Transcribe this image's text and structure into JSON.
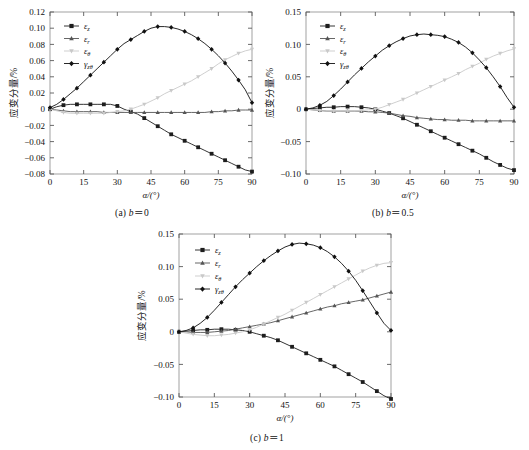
{
  "figure": {
    "panels": [
      {
        "id": "a",
        "caption": "（a）b＝0",
        "caption_label": "(a)",
        "caption_param": "b",
        "caption_value": "0",
        "x_axis_title": "α/(°)",
        "y_axis_title": "应变分量/%",
        "x_ticks": [
          "0",
          "15",
          "30",
          "45",
          "60",
          "75",
          "90"
        ],
        "y_ticks": [
          "0.12",
          "0.10",
          "0.08",
          "0.06",
          "0.04",
          "0.02",
          "0",
          "-0.02",
          "-0.04",
          "-0.06",
          "-0.08"
        ]
      },
      {
        "id": "b",
        "caption": "（b）b＝0.5",
        "caption_label": "(b)",
        "caption_param": "b",
        "caption_value": "0.5",
        "x_axis_title": "α/(°)",
        "y_axis_title": "应变分量/%",
        "x_ticks": [
          "0",
          "15",
          "30",
          "45",
          "60",
          "75",
          "90"
        ],
        "y_ticks": [
          "0.15",
          "0.10",
          "0.05",
          "0",
          "-0.05",
          "-0.10"
        ]
      },
      {
        "id": "c",
        "caption": "（c）b＝1",
        "caption_label": "(c)",
        "caption_param": "b",
        "caption_value": "1",
        "x_axis_title": "α/(°)",
        "y_axis_title": "应变分量/%",
        "x_ticks": [
          "0",
          "15",
          "30",
          "45",
          "60",
          "75",
          "90"
        ],
        "y_ticks": [
          "0.15",
          "0.10",
          "0.05",
          "0",
          "-0.05",
          "-0.10"
        ]
      }
    ],
    "legend_entries": [
      {
        "key": "eps_z",
        "label": "εz",
        "base": "ε",
        "sub": "z",
        "color": "#1d1d1d",
        "marker": "square"
      },
      {
        "key": "eps_r",
        "label": "εr",
        "base": "ε",
        "sub": "r",
        "color": "#555555",
        "marker": "triangle-up"
      },
      {
        "key": "eps_theta",
        "label": "εθ",
        "base": "ε",
        "sub": "θ",
        "color": "#c9c9c9",
        "marker": "triangle-down"
      },
      {
        "key": "gamma_zt",
        "label": "γzθ",
        "base": "γ",
        "sub": "zθ",
        "color": "#111111",
        "marker": "diamond"
      }
    ]
  },
  "chart_data": [
    {
      "type": "line",
      "panel": "a",
      "title": "（a）b＝0",
      "xlabel": "α/(°)",
      "ylabel": "应变分量/%",
      "xlim": [
        0,
        90
      ],
      "ylim": [
        -0.08,
        0.12
      ],
      "xticks": [
        0,
        15,
        30,
        45,
        60,
        75,
        90
      ],
      "yticks": [
        -0.08,
        -0.06,
        -0.04,
        -0.02,
        0,
        0.02,
        0.04,
        0.06,
        0.08,
        0.1,
        0.12
      ],
      "grid": false,
      "legend_position": "upper-left",
      "x": [
        0,
        3,
        6,
        9,
        12,
        15,
        18,
        21,
        24,
        27,
        30,
        33,
        36,
        39,
        42,
        45,
        48,
        51,
        54,
        57,
        60,
        63,
        66,
        69,
        72,
        75,
        78,
        81,
        84,
        87,
        90
      ],
      "series": [
        {
          "name": "εz",
          "color": "#1d1d1d",
          "marker": "square",
          "values": [
            0.0,
            0.003,
            0.005,
            0.006,
            0.006,
            0.006,
            0.006,
            0.006,
            0.006,
            0.006,
            0.004,
            0.0,
            -0.003,
            -0.006,
            -0.011,
            -0.016,
            -0.021,
            -0.026,
            -0.031,
            -0.035,
            -0.039,
            -0.043,
            -0.047,
            -0.051,
            -0.055,
            -0.059,
            -0.063,
            -0.067,
            -0.071,
            -0.075,
            -0.077
          ]
        },
        {
          "name": "εr",
          "color": "#555555",
          "marker": "triangle-up",
          "values": [
            0.0,
            -0.001,
            -0.002,
            -0.003,
            -0.003,
            -0.003,
            -0.003,
            -0.003,
            -0.004,
            -0.004,
            -0.004,
            -0.004,
            -0.004,
            -0.004,
            -0.004,
            -0.004,
            -0.004,
            -0.004,
            -0.004,
            -0.004,
            -0.004,
            -0.004,
            -0.004,
            -0.004,
            -0.003,
            -0.003,
            -0.002,
            -0.002,
            -0.001,
            -0.001,
            -0.001
          ]
        },
        {
          "name": "εθ",
          "color": "#c9c9c9",
          "marker": "triangle-down",
          "values": [
            0.0,
            -0.002,
            -0.004,
            -0.005,
            -0.005,
            -0.005,
            -0.005,
            -0.005,
            -0.005,
            -0.004,
            -0.003,
            -0.002,
            0.0,
            0.003,
            0.006,
            0.01,
            0.014,
            0.019,
            0.023,
            0.027,
            0.031,
            0.035,
            0.04,
            0.045,
            0.05,
            0.056,
            0.061,
            0.065,
            0.069,
            0.072,
            0.074
          ]
        },
        {
          "name": "γzθ",
          "color": "#111111",
          "marker": "diamond",
          "values": [
            0.002,
            0.006,
            0.012,
            0.019,
            0.026,
            0.034,
            0.042,
            0.05,
            0.058,
            0.066,
            0.074,
            0.081,
            0.086,
            0.091,
            0.096,
            0.1,
            0.102,
            0.102,
            0.101,
            0.099,
            0.096,
            0.092,
            0.087,
            0.081,
            0.074,
            0.066,
            0.057,
            0.047,
            0.036,
            0.024,
            0.008
          ]
        }
      ]
    },
    {
      "type": "line",
      "panel": "b",
      "title": "（b）b＝0.5",
      "xlabel": "α/(°)",
      "ylabel": "应变分量/%",
      "xlim": [
        0,
        90
      ],
      "ylim": [
        -0.1,
        0.15
      ],
      "xticks": [
        0,
        15,
        30,
        45,
        60,
        75,
        90
      ],
      "yticks": [
        -0.1,
        -0.05,
        0,
        0.05,
        0.1,
        0.15
      ],
      "grid": false,
      "legend_position": "upper-left",
      "x": [
        0,
        3,
        6,
        9,
        12,
        15,
        18,
        21,
        24,
        27,
        30,
        33,
        36,
        39,
        42,
        45,
        48,
        51,
        54,
        57,
        60,
        63,
        66,
        69,
        72,
        75,
        78,
        81,
        84,
        87,
        90
      ],
      "series": [
        {
          "name": "εz",
          "color": "#1d1d1d",
          "marker": "square",
          "values": [
            0.0,
            0.001,
            0.002,
            0.003,
            0.003,
            0.004,
            0.004,
            0.004,
            0.003,
            0.002,
            0.0,
            -0.003,
            -0.006,
            -0.01,
            -0.014,
            -0.019,
            -0.024,
            -0.029,
            -0.034,
            -0.039,
            -0.044,
            -0.049,
            -0.054,
            -0.059,
            -0.064,
            -0.069,
            -0.075,
            -0.081,
            -0.086,
            -0.091,
            -0.094
          ]
        },
        {
          "name": "εr",
          "color": "#555555",
          "marker": "triangle-up",
          "values": [
            0.0,
            -0.001,
            -0.002,
            -0.003,
            -0.003,
            -0.003,
            -0.003,
            -0.003,
            -0.003,
            -0.004,
            -0.004,
            -0.005,
            -0.006,
            -0.008,
            -0.01,
            -0.011,
            -0.013,
            -0.014,
            -0.015,
            -0.016,
            -0.016,
            -0.017,
            -0.017,
            -0.017,
            -0.018,
            -0.018,
            -0.018,
            -0.018,
            -0.018,
            -0.018,
            -0.018
          ]
        },
        {
          "name": "εθ",
          "color": "#c9c9c9",
          "marker": "triangle-down",
          "values": [
            0.0,
            -0.001,
            -0.002,
            -0.003,
            -0.003,
            -0.003,
            -0.003,
            -0.003,
            -0.002,
            -0.001,
            0.0,
            0.003,
            0.007,
            0.011,
            0.015,
            0.02,
            0.025,
            0.03,
            0.035,
            0.04,
            0.045,
            0.05,
            0.055,
            0.061,
            0.066,
            0.071,
            0.077,
            0.082,
            0.086,
            0.09,
            0.093
          ]
        },
        {
          "name": "γzθ",
          "color": "#111111",
          "marker": "diamond",
          "values": [
            0.0,
            0.002,
            0.006,
            0.012,
            0.021,
            0.031,
            0.042,
            0.053,
            0.063,
            0.073,
            0.082,
            0.091,
            0.098,
            0.104,
            0.109,
            0.113,
            0.115,
            0.116,
            0.115,
            0.114,
            0.112,
            0.108,
            0.103,
            0.096,
            0.087,
            0.076,
            0.064,
            0.05,
            0.035,
            0.018,
            0.003
          ]
        }
      ]
    },
    {
      "type": "line",
      "panel": "c",
      "title": "（c）b＝1",
      "xlabel": "α/(°)",
      "ylabel": "应变分量/%",
      "xlim": [
        0,
        90
      ],
      "ylim": [
        -0.1,
        0.15
      ],
      "xticks": [
        0,
        15,
        30,
        45,
        60,
        75,
        90
      ],
      "yticks": [
        -0.1,
        -0.05,
        0,
        0.05,
        0.1,
        0.15
      ],
      "grid": false,
      "legend_position": "upper-left",
      "x": [
        0,
        3,
        6,
        9,
        12,
        15,
        18,
        21,
        24,
        27,
        30,
        33,
        36,
        39,
        42,
        45,
        48,
        51,
        54,
        57,
        60,
        63,
        66,
        69,
        72,
        75,
        78,
        81,
        84,
        87,
        90
      ],
      "series": [
        {
          "name": "εz",
          "color": "#1d1d1d",
          "marker": "square",
          "values": [
            0.0,
            0.001,
            0.002,
            0.003,
            0.003,
            0.004,
            0.004,
            0.004,
            0.003,
            0.002,
            0.0,
            -0.003,
            -0.006,
            -0.009,
            -0.013,
            -0.018,
            -0.023,
            -0.028,
            -0.033,
            -0.038,
            -0.043,
            -0.048,
            -0.053,
            -0.059,
            -0.065,
            -0.071,
            -0.077,
            -0.084,
            -0.091,
            -0.098,
            -0.103
          ]
        },
        {
          "name": "εr",
          "color": "#555555",
          "marker": "triangle-up",
          "values": [
            0.0,
            0.0,
            -0.001,
            -0.001,
            -0.001,
            0.0,
            0.001,
            0.002,
            0.004,
            0.006,
            0.008,
            0.01,
            0.012,
            0.014,
            0.017,
            0.02,
            0.023,
            0.026,
            0.029,
            0.032,
            0.035,
            0.038,
            0.04,
            0.043,
            0.045,
            0.047,
            0.049,
            0.052,
            0.055,
            0.058,
            0.061
          ]
        },
        {
          "name": "εθ",
          "color": "#c9c9c9",
          "marker": "triangle-down",
          "values": [
            0.0,
            -0.002,
            -0.004,
            -0.005,
            -0.006,
            -0.006,
            -0.005,
            -0.004,
            -0.002,
            0.0,
            0.003,
            0.007,
            0.012,
            0.017,
            0.022,
            0.027,
            0.033,
            0.039,
            0.045,
            0.051,
            0.057,
            0.063,
            0.069,
            0.075,
            0.081,
            0.087,
            0.093,
            0.098,
            0.102,
            0.105,
            0.106
          ]
        },
        {
          "name": "γzθ",
          "color": "#111111",
          "marker": "diamond",
          "values": [
            0.0,
            0.002,
            0.006,
            0.013,
            0.022,
            0.033,
            0.045,
            0.057,
            0.069,
            0.08,
            0.09,
            0.1,
            0.109,
            0.117,
            0.124,
            0.13,
            0.134,
            0.136,
            0.135,
            0.133,
            0.129,
            0.123,
            0.115,
            0.105,
            0.093,
            0.079,
            0.063,
            0.046,
            0.029,
            0.013,
            0.002
          ]
        }
      ]
    }
  ]
}
